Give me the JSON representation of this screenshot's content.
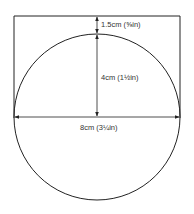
{
  "diagram": {
    "type": "dimension-drawing",
    "labels": {
      "top_gap": "1.5cm (⅝in)",
      "radius": "4cm (1½in)",
      "diameter": "8cm (3¼in)"
    },
    "colors": {
      "line": "#222222",
      "background": "#ffffff"
    }
  }
}
